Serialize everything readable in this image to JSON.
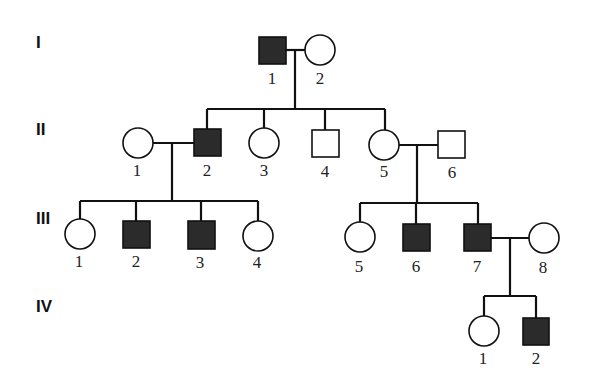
{
  "diagram": {
    "type": "pedigree",
    "colors": {
      "affected": "#2b2b2b",
      "unaffected": "#ffffff",
      "line": "#111111"
    },
    "generations": [
      {
        "label": "I",
        "y": 50,
        "individuals": [
          {
            "id": "I-1",
            "number": "1",
            "sex": "male",
            "affected": true,
            "x": 272,
            "y": 50
          },
          {
            "id": "I-2",
            "number": "2",
            "sex": "female",
            "affected": false,
            "x": 320,
            "y": 50
          }
        ]
      },
      {
        "label": "II",
        "y": 143,
        "individuals": [
          {
            "id": "II-1",
            "number": "1",
            "sex": "female",
            "affected": false,
            "x": 138,
            "y": 143
          },
          {
            "id": "II-2",
            "number": "2",
            "sex": "male",
            "affected": true,
            "x": 207,
            "y": 143
          },
          {
            "id": "II-3",
            "number": "3",
            "sex": "female",
            "affected": false,
            "x": 264,
            "y": 143
          },
          {
            "id": "II-4",
            "number": "4",
            "sex": "male",
            "affected": false,
            "x": 325,
            "y": 144
          },
          {
            "id": "II-5",
            "number": "5",
            "sex": "female",
            "affected": false,
            "x": 384,
            "y": 145
          },
          {
            "id": "II-6",
            "number": "6",
            "sex": "male",
            "affected": false,
            "x": 451,
            "y": 145
          }
        ]
      },
      {
        "label": "III",
        "y": 236,
        "individuals": [
          {
            "id": "III-1",
            "number": "1",
            "sex": "female",
            "affected": false,
            "x": 80,
            "y": 234
          },
          {
            "id": "III-2",
            "number": "2",
            "sex": "male",
            "affected": true,
            "x": 136,
            "y": 235
          },
          {
            "id": "III-3",
            "number": "3",
            "sex": "male",
            "affected": true,
            "x": 201,
            "y": 235
          },
          {
            "id": "III-4",
            "number": "4",
            "sex": "female",
            "affected": false,
            "x": 258,
            "y": 236
          },
          {
            "id": "III-5",
            "number": "5",
            "sex": "female",
            "affected": false,
            "x": 360,
            "y": 237
          },
          {
            "id": "III-6",
            "number": "6",
            "sex": "male",
            "affected": true,
            "x": 416,
            "y": 237
          },
          {
            "id": "III-7",
            "number": "7",
            "sex": "male",
            "affected": true,
            "x": 477,
            "y": 237
          },
          {
            "id": "III-8",
            "number": "8",
            "sex": "female",
            "affected": false,
            "x": 544,
            "y": 238
          }
        ]
      },
      {
        "label": "IV",
        "y": 331,
        "individuals": [
          {
            "id": "IV-1",
            "number": "1",
            "sex": "female",
            "affected": false,
            "x": 484,
            "y": 331
          },
          {
            "id": "IV-2",
            "number": "2",
            "sex": "male",
            "affected": true,
            "x": 536,
            "y": 331
          }
        ]
      }
    ],
    "matings": [
      {
        "partners": [
          "I-1",
          "I-2"
        ],
        "children": [
          "II-2",
          "II-3",
          "II-4",
          "II-5"
        ]
      },
      {
        "partners": [
          "II-1",
          "II-2"
        ],
        "children": [
          "III-1",
          "III-2",
          "III-3",
          "III-4"
        ]
      },
      {
        "partners": [
          "II-5",
          "II-6"
        ],
        "children": [
          "III-5",
          "III-6",
          "III-7"
        ]
      },
      {
        "partners": [
          "III-7",
          "III-8"
        ],
        "children": [
          "IV-1",
          "IV-2"
        ]
      }
    ]
  },
  "labels": {
    "gen_I": "I",
    "gen_II": "II",
    "gen_III": "III",
    "gen_IV": "IV",
    "I1": "1",
    "I2": "2",
    "II1": "1",
    "II2": "2",
    "II3": "3",
    "II4": "4",
    "II5": "5",
    "II6": "6",
    "III1": "1",
    "III2": "2",
    "III3": "3",
    "III4": "4",
    "III5": "5",
    "III6": "6",
    "III7": "7",
    "III8": "8",
    "IV1": "1",
    "IV2": "2"
  }
}
